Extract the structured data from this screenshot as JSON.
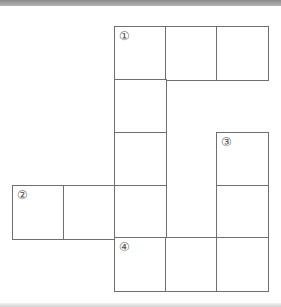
{
  "diagram": {
    "type": "crossword-grid",
    "cell_size_px": 51,
    "grid_origin": {
      "x": 12,
      "y": 26
    },
    "line_color": "#6f6f6f",
    "cells": [
      {
        "row": 0,
        "col": 2,
        "label": "①"
      },
      {
        "row": 0,
        "col": 3,
        "label": ""
      },
      {
        "row": 0,
        "col": 4,
        "label": ""
      },
      {
        "row": 1,
        "col": 2,
        "label": ""
      },
      {
        "row": 2,
        "col": 2,
        "label": ""
      },
      {
        "row": 2,
        "col": 4,
        "label": "③"
      },
      {
        "row": 3,
        "col": 0,
        "label": "②"
      },
      {
        "row": 3,
        "col": 1,
        "label": ""
      },
      {
        "row": 3,
        "col": 2,
        "label": ""
      },
      {
        "row": 3,
        "col": 4,
        "label": ""
      },
      {
        "row": 4,
        "col": 2,
        "label": "④"
      },
      {
        "row": 4,
        "col": 3,
        "label": ""
      },
      {
        "row": 4,
        "col": 4,
        "label": ""
      }
    ],
    "clue_numbers": [
      "①",
      "②",
      "③",
      "④"
    ]
  }
}
